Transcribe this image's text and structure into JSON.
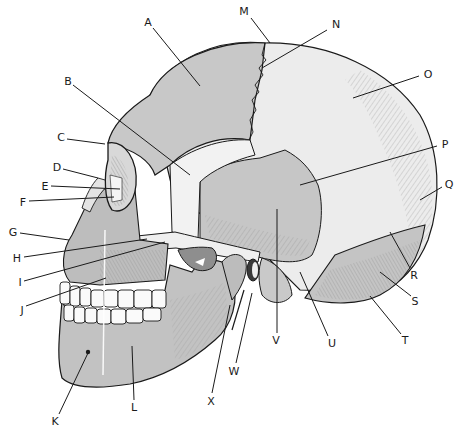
{
  "diagram": {
    "type": "anatomical-diagram",
    "colors": {
      "bone_dark": "#b9b9b9",
      "bone_mid": "#cfcfcf",
      "bone_light": "#ececec",
      "outline": "#1a1a1a",
      "background": "#ffffff"
    },
    "labels": [
      {
        "text": "A",
        "x": 148,
        "y": 22,
        "line": [
          153,
          28,
          200,
          86
        ]
      },
      {
        "text": "B",
        "x": 68,
        "y": 81,
        "line": [
          73,
          85,
          190,
          175
        ]
      },
      {
        "text": "C",
        "x": 61,
        "y": 137,
        "line": [
          67,
          139,
          105,
          144
        ]
      },
      {
        "text": "D",
        "x": 57,
        "y": 167,
        "line": [
          63,
          169,
          98,
          178
        ]
      },
      {
        "text": "E",
        "x": 45,
        "y": 186,
        "line": [
          51,
          186,
          120,
          189
        ]
      },
      {
        "text": "F",
        "x": 23,
        "y": 202,
        "line": [
          29,
          201,
          114,
          197
        ]
      },
      {
        "text": "G",
        "x": 13,
        "y": 232,
        "line": [
          20,
          233,
          69,
          240
        ]
      },
      {
        "text": "H",
        "x": 17,
        "y": 258,
        "line": [
          24,
          257,
          147,
          239
        ]
      },
      {
        "text": "I",
        "x": 20,
        "y": 282,
        "line": [
          24,
          281,
          165,
          242
        ]
      },
      {
        "text": "J",
        "x": 22,
        "y": 310,
        "line": [
          26,
          306,
          106,
          278
        ]
      },
      {
        "text": "K",
        "x": 55,
        "y": 421,
        "line": [
          59,
          414,
          88,
          353
        ]
      },
      {
        "text": "L",
        "x": 134,
        "y": 407,
        "line": [
          134,
          400,
          132,
          346
        ]
      },
      {
        "text": "M",
        "x": 244,
        "y": 11,
        "line": [
          251,
          18,
          270,
          43
        ]
      },
      {
        "text": "N",
        "x": 336,
        "y": 24,
        "line": [
          327,
          30,
          262,
          68
        ]
      },
      {
        "text": "O",
        "x": 428,
        "y": 74,
        "line": [
          419,
          76,
          353,
          98
        ]
      },
      {
        "text": "P",
        "x": 445,
        "y": 144,
        "line": [
          437,
          146,
          300,
          185
        ]
      },
      {
        "text": "Q",
        "x": 449,
        "y": 184,
        "line": [
          442,
          187,
          420,
          200
        ]
      },
      {
        "text": "R",
        "x": 414,
        "y": 275,
        "line": [
          410,
          268,
          390,
          232
        ]
      },
      {
        "text": "S",
        "x": 415,
        "y": 301,
        "line": [
          411,
          296,
          380,
          272
        ]
      },
      {
        "text": "T",
        "x": 405,
        "y": 340,
        "line": [
          401,
          334,
          370,
          296
        ]
      },
      {
        "text": "U",
        "x": 332,
        "y": 343,
        "line": [
          328,
          336,
          300,
          272
        ]
      },
      {
        "text": "V",
        "x": 276,
        "y": 340,
        "line": [
          277,
          333,
          277,
          209
        ]
      },
      {
        "text": "W",
        "x": 234,
        "y": 371,
        "line": [
          236,
          363,
          252,
          293
        ]
      },
      {
        "text": "X",
        "x": 211,
        "y": 401,
        "line": [
          212,
          393,
          230,
          305
        ]
      }
    ]
  }
}
